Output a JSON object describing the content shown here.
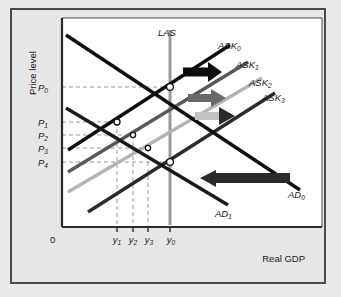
{
  "figure": {
    "background": "#e6e6e6",
    "plot_background": "#ffffff",
    "border_color": "#4a4a4a"
  },
  "axes": {
    "y_axis_title": "Price level",
    "x_axis_title": "Real GDP",
    "origin_label": "0",
    "y_ticks": [
      {
        "label": "P",
        "sub": "0",
        "y": 87
      },
      {
        "label": "P",
        "sub": "1",
        "y": 122
      },
      {
        "label": "P",
        "sub": "2",
        "y": 135
      },
      {
        "label": "P",
        "sub": "3",
        "y": 148
      },
      {
        "label": "P",
        "sub": "4",
        "y": 162
      }
    ],
    "x_ticks": [
      {
        "label": "y",
        "sub": "1",
        "x": 117
      },
      {
        "label": "y",
        "sub": "2",
        "x": 133
      },
      {
        "label": "y",
        "sub": "3",
        "x": 148
      },
      {
        "label": "y",
        "sub": "0",
        "x": 170
      }
    ]
  },
  "chart_data": {
    "type": "line",
    "title": "",
    "xlabel": "Real GDP",
    "ylabel": "Price level",
    "grid": "dashed-guides",
    "legend": "inline-curve-labels",
    "curves": [
      {
        "name": "LAS",
        "label": "LAS",
        "sub": "",
        "color": "#9a9a9a",
        "width": 3,
        "kind": "vertical",
        "x": 170,
        "y1": 30,
        "y2": 225
      },
      {
        "name": "ASK0",
        "label": "ASK",
        "sub": "0",
        "color": "#0d0d0d",
        "width": 3.4,
        "kind": "upward",
        "x1": 68,
        "y1": 150,
        "x2": 230,
        "y2": 45
      },
      {
        "name": "ASK1",
        "label": "ASK",
        "sub": "1",
        "color": "#585858",
        "width": 3.4,
        "kind": "upward",
        "x1": 68,
        "y1": 172,
        "x2": 248,
        "y2": 62
      },
      {
        "name": "ASK2",
        "label": "ASK",
        "sub": "2",
        "color": "#b4b4b4",
        "width": 3.4,
        "kind": "upward",
        "x1": 68,
        "y1": 192,
        "x2": 262,
        "y2": 78
      },
      {
        "name": "ASK3",
        "label": "ASK",
        "sub": "3",
        "color": "#2b2b2b",
        "width": 3.4,
        "kind": "upward",
        "x1": 88,
        "y1": 212,
        "x2": 275,
        "y2": 93
      },
      {
        "name": "AD0",
        "label": "AD",
        "sub": "0",
        "color": "#0d0d0d",
        "width": 3.4,
        "kind": "downward",
        "x1": 66,
        "y1": 35,
        "x2": 300,
        "y2": 190
      },
      {
        "name": "AD1",
        "label": "AD",
        "sub": "1",
        "color": "#1a1a1a",
        "width": 3.4,
        "kind": "downward",
        "x1": 66,
        "y1": 108,
        "x2": 228,
        "y2": 205
      }
    ],
    "equilibria": [
      {
        "name": "E0",
        "x": 170,
        "y": 87,
        "filled": false,
        "r": 3.4
      },
      {
        "name": "E1",
        "x": 117,
        "y": 122,
        "filled": false,
        "r": 3.0
      },
      {
        "name": "E2",
        "x": 133,
        "y": 135,
        "filled": false,
        "r": 2.6
      },
      {
        "name": "E3",
        "x": 148,
        "y": 148,
        "filled": false,
        "r": 2.6
      },
      {
        "name": "E4",
        "x": 170,
        "y": 162,
        "filled": false,
        "r": 3.4
      }
    ],
    "shift_arrows": [
      {
        "name": "ask0-to-ask1-shift",
        "direction": "right",
        "color": "#0d0d0d",
        "x1": 183,
        "y": 72,
        "x2": 222,
        "thickness": 9
      },
      {
        "name": "ask1-to-ask2-shift",
        "direction": "right",
        "color": "#6a6a6a",
        "x1": 188,
        "y": 98,
        "x2": 226,
        "thickness": 8
      },
      {
        "name": "ask2-to-ask3-shift",
        "direction": "right",
        "color": "#c2c2c2",
        "x1": 195,
        "y": 116,
        "x2": 235,
        "thickness": 8
      },
      {
        "name": "ad0-to-ad1-shift",
        "direction": "left",
        "color": "#2b2b2b",
        "x1": 290,
        "y": 178,
        "x2": 200,
        "thickness": 10
      }
    ],
    "guide_lines": [
      {
        "from": "P0",
        "to": "E0",
        "style": "dashed"
      },
      {
        "from": "P1",
        "to": "E1",
        "style": "dashed"
      },
      {
        "from": "P2",
        "to": "E2",
        "style": "dashed"
      },
      {
        "from": "P3",
        "to": "E3",
        "style": "dashed"
      },
      {
        "from": "P4",
        "to": "E4",
        "style": "dashed"
      },
      {
        "from": "y1",
        "to": "E1",
        "style": "dashed"
      },
      {
        "from": "y2",
        "to": "E2",
        "style": "dashed"
      },
      {
        "from": "y3",
        "to": "E3",
        "style": "dashed"
      },
      {
        "from": "y0",
        "to": "E0",
        "style": "dashed"
      }
    ]
  }
}
